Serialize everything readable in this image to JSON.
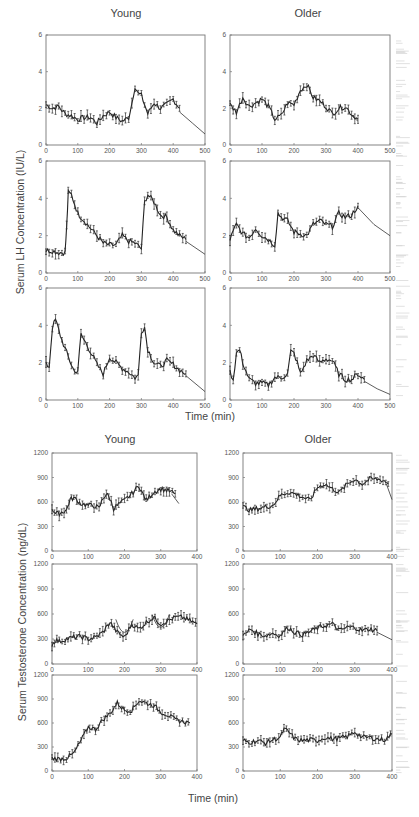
{
  "figure": {
    "top_block": {
      "col_titles": [
        "Young",
        "Older"
      ],
      "ylabel": "Serum LH Concentration (IU/L)",
      "xlabel": "Time (min)"
    },
    "bottom_block": {
      "col_titles": [
        "Young",
        "Older"
      ],
      "ylabel": "Serum Testosterone Concentration (ng/dL)",
      "xlabel": "Time (min)"
    }
  },
  "chart_data": [
    {
      "type": "scatter",
      "panel": "LH Young 1",
      "title": "Young",
      "xlabel": "Time (min)",
      "ylabel": "Serum LH Concentration (IU/L)",
      "xlim": [
        0,
        500
      ],
      "ylim": [
        0,
        6
      ],
      "xticks": [
        0,
        100,
        200,
        300,
        400,
        500
      ],
      "yticks": [
        0,
        2,
        4,
        6
      ],
      "x": [
        0,
        20,
        40,
        60,
        80,
        100,
        120,
        140,
        160,
        180,
        200,
        220,
        240,
        260,
        270,
        280,
        290,
        300,
        320,
        340,
        360,
        380,
        400,
        420
      ],
      "values": [
        2.2,
        2.0,
        2.1,
        1.7,
        1.6,
        1.4,
        1.5,
        1.5,
        1.2,
        1.6,
        1.8,
        1.5,
        1.3,
        1.5,
        2.3,
        3.2,
        2.8,
        2.7,
        1.7,
        2.3,
        2.0,
        2.2,
        2.5,
        2.0
      ],
      "fit_tail": [
        [
          420,
          1.8
        ],
        [
          460,
          1.2
        ],
        [
          500,
          0.6
        ]
      ]
    },
    {
      "type": "scatter",
      "panel": "LH Young 2",
      "xlim": [
        0,
        500
      ],
      "ylim": [
        0,
        6
      ],
      "xticks": [
        0,
        100,
        200,
        300,
        400,
        500
      ],
      "yticks": [
        0,
        2,
        4,
        6
      ],
      "x": [
        0,
        20,
        40,
        60,
        65,
        70,
        80,
        100,
        120,
        140,
        160,
        180,
        200,
        220,
        240,
        260,
        280,
        300,
        310,
        320,
        340,
        360,
        380,
        400,
        420,
        440
      ],
      "values": [
        1.2,
        1.2,
        1.1,
        1.1,
        2.5,
        4.3,
        4.2,
        3.2,
        2.8,
        2.4,
        2.0,
        1.6,
        1.5,
        1.5,
        2.0,
        1.7,
        1.6,
        1.3,
        3.8,
        4.2,
        3.8,
        3.1,
        3.0,
        2.3,
        2.0,
        1.8
      ],
      "fit_tail": [
        [
          440,
          1.7
        ],
        [
          500,
          1.0
        ]
      ]
    },
    {
      "type": "scatter",
      "panel": "LH Young 3",
      "xlim": [
        0,
        500
      ],
      "ylim": [
        0,
        6
      ],
      "xticks": [
        0,
        100,
        200,
        300,
        400,
        500
      ],
      "yticks": [
        0,
        2,
        4,
        6
      ],
      "x": [
        0,
        10,
        20,
        30,
        50,
        70,
        90,
        100,
        110,
        120,
        140,
        160,
        180,
        200,
        220,
        240,
        260,
        280,
        290,
        300,
        310,
        320,
        340,
        360,
        380,
        400,
        420,
        440
      ],
      "values": [
        1.9,
        1.8,
        3.9,
        4.3,
        3.2,
        2.3,
        1.5,
        1.6,
        3.5,
        3.2,
        2.6,
        1.9,
        1.4,
        2.3,
        2.0,
        1.7,
        1.5,
        1.2,
        1.3,
        3.7,
        3.9,
        2.7,
        2.0,
        1.8,
        2.1,
        1.9,
        1.6,
        1.4
      ],
      "fit_tail": [
        [
          440,
          1.3
        ],
        [
          500,
          0.45
        ]
      ]
    },
    {
      "type": "scatter",
      "panel": "LH Older 1",
      "title": "Older",
      "xlim": [
        0,
        500
      ],
      "ylim": [
        0,
        6
      ],
      "xticks": [
        0,
        100,
        200,
        300,
        400,
        500
      ],
      "yticks": [
        0,
        2,
        4,
        6
      ],
      "x": [
        0,
        20,
        40,
        60,
        80,
        100,
        120,
        140,
        160,
        180,
        200,
        220,
        240,
        260,
        280,
        300,
        320,
        340,
        360,
        380,
        400
      ],
      "values": [
        2.2,
        1.8,
        2.6,
        2.1,
        2.3,
        2.5,
        2.1,
        1.4,
        1.6,
        2.3,
        2.2,
        3.0,
        3.3,
        2.6,
        2.4,
        2.1,
        1.7,
        2.0,
        2.1,
        1.7,
        1.4
      ],
      "fit_tail": [
        [
          380,
          1.6
        ],
        [
          400,
          1.3
        ]
      ]
    },
    {
      "type": "scatter",
      "panel": "LH Older 2",
      "xlim": [
        0,
        500
      ],
      "ylim": [
        0,
        6
      ],
      "xticks": [
        0,
        100,
        200,
        300,
        400,
        500
      ],
      "yticks": [
        0,
        2,
        4,
        6
      ],
      "x": [
        0,
        20,
        40,
        60,
        80,
        100,
        120,
        140,
        150,
        160,
        180,
        200,
        220,
        240,
        260,
        280,
        300,
        320,
        340,
        360,
        380,
        400
      ],
      "values": [
        1.8,
        2.6,
        2.1,
        1.9,
        2.4,
        2.0,
        1.8,
        1.5,
        3.2,
        3.0,
        2.8,
        2.2,
        2.1,
        2.0,
        2.6,
        2.8,
        2.6,
        2.5,
        3.2,
        3.0,
        3.1,
        3.6
      ],
      "fit_tail": [
        [
          400,
          3.5
        ],
        [
          450,
          2.6
        ],
        [
          500,
          2.0
        ]
      ]
    },
    {
      "type": "scatter",
      "panel": "LH Older 3",
      "xlim": [
        0,
        500
      ],
      "ylim": [
        0,
        6
      ],
      "xticks": [
        0,
        100,
        200,
        300,
        400,
        500
      ],
      "yticks": [
        0,
        2,
        4,
        6
      ],
      "x": [
        0,
        10,
        20,
        30,
        40,
        60,
        80,
        100,
        120,
        140,
        160,
        180,
        190,
        200,
        210,
        220,
        240,
        260,
        280,
        300,
        320,
        340,
        360,
        380,
        400,
        420
      ],
      "values": [
        1.5,
        1.1,
        2.5,
        2.7,
        2.0,
        1.1,
        0.9,
        0.9,
        0.8,
        1.2,
        1.2,
        1.4,
        2.6,
        2.5,
        2.0,
        1.4,
        2.1,
        2.4,
        2.0,
        2.2,
        2.1,
        1.4,
        1.1,
        1.1,
        1.4,
        1.1
      ],
      "fit_tail": [
        [
          420,
          1.0
        ],
        [
          460,
          0.6
        ],
        [
          500,
          0.3
        ]
      ]
    },
    {
      "type": "scatter",
      "panel": "T Young 1",
      "title": "Young",
      "xlabel": "Time (min)",
      "ylabel": "Serum Testosterone Concentration (ng/dL)",
      "xlim": [
        0,
        400
      ],
      "ylim": [
        0,
        1200
      ],
      "xticks": [
        0,
        100,
        200,
        300,
        400
      ],
      "yticks": [
        0,
        300,
        600,
        900,
        1200
      ],
      "x": [
        0,
        10,
        20,
        30,
        40,
        50,
        60,
        80,
        100,
        120,
        130,
        140,
        150,
        160,
        170,
        180,
        200,
        220,
        240,
        250,
        260,
        280,
        300,
        320,
        340
      ],
      "values": [
        520,
        460,
        460,
        480,
        500,
        630,
        650,
        580,
        560,
        550,
        520,
        640,
        700,
        640,
        520,
        560,
        620,
        700,
        800,
        700,
        620,
        720,
        760,
        740,
        700
      ],
      "fit_tail": [
        [
          330,
          700
        ],
        [
          350,
          580
        ]
      ]
    },
    {
      "type": "scatter",
      "panel": "T Young 2",
      "xlim": [
        0,
        400
      ],
      "ylim": [
        0,
        1200
      ],
      "xticks": [
        0,
        100,
        200,
        300,
        400
      ],
      "yticks": [
        0,
        300,
        600,
        900,
        1200
      ],
      "x": [
        0,
        10,
        20,
        40,
        60,
        80,
        100,
        120,
        140,
        160,
        180,
        200,
        220,
        240,
        260,
        280,
        300,
        320,
        340,
        360,
        380,
        400
      ],
      "values": [
        230,
        290,
        270,
        300,
        320,
        330,
        300,
        320,
        380,
        500,
        380,
        320,
        480,
        420,
        500,
        560,
        480,
        520,
        560,
        560,
        520,
        480
      ],
      "fit_dips": [
        [
          200,
          320
        ],
        [
          300,
          380
        ]
      ]
    },
    {
      "type": "scatter",
      "panel": "T Young 3",
      "xlim": [
        0,
        400
      ],
      "ylim": [
        0,
        1200
      ],
      "xticks": [
        0,
        100,
        200,
        300,
        400
      ],
      "yticks": [
        0,
        300,
        600,
        900,
        1200
      ],
      "x": [
        0,
        20,
        40,
        60,
        80,
        100,
        120,
        140,
        160,
        180,
        200,
        220,
        240,
        260,
        280,
        300,
        320,
        340,
        360,
        380
      ],
      "values": [
        160,
        150,
        160,
        220,
        380,
        550,
        520,
        640,
        720,
        850,
        760,
        760,
        880,
        850,
        820,
        740,
        700,
        640,
        620,
        600
      ]
    },
    {
      "type": "scatter",
      "panel": "T Older 1",
      "title": "Older",
      "xlim": [
        0,
        400
      ],
      "ylim": [
        0,
        1200
      ],
      "xticks": [
        0,
        100,
        200,
        300,
        400
      ],
      "yticks": [
        0,
        300,
        600,
        900,
        1200
      ],
      "x": [
        0,
        20,
        40,
        60,
        80,
        100,
        120,
        140,
        160,
        180,
        200,
        220,
        240,
        260,
        280,
        300,
        320,
        340,
        360,
        380,
        390
      ],
      "values": [
        540,
        500,
        520,
        540,
        560,
        680,
        720,
        700,
        660,
        620,
        780,
        820,
        760,
        720,
        820,
        880,
        820,
        880,
        880,
        860,
        820
      ],
      "fit_tail": [
        [
          385,
          820
        ],
        [
          400,
          630
        ]
      ]
    },
    {
      "type": "scatter",
      "panel": "T Older 2",
      "xlim": [
        0,
        400
      ],
      "ylim": [
        0,
        1200
      ],
      "xticks": [
        0,
        100,
        200,
        300,
        400
      ],
      "yticks": [
        0,
        300,
        600,
        900,
        1200
      ],
      "x": [
        0,
        20,
        40,
        60,
        80,
        100,
        120,
        140,
        160,
        180,
        200,
        220,
        240,
        260,
        280,
        300,
        320,
        340,
        360
      ],
      "values": [
        330,
        420,
        360,
        340,
        370,
        340,
        440,
        380,
        350,
        390,
        430,
        460,
        480,
        400,
        440,
        440,
        400,
        420,
        400
      ],
      "fit_tail": [
        [
          360,
          380
        ],
        [
          400,
          290
        ]
      ]
    },
    {
      "type": "scatter",
      "panel": "T Older 3",
      "xlim": [
        0,
        400
      ],
      "ylim": [
        0,
        1200
      ],
      "xticks": [
        0,
        100,
        200,
        300,
        400
      ],
      "yticks": [
        0,
        300,
        600,
        900,
        1200
      ],
      "x": [
        0,
        20,
        40,
        60,
        80,
        100,
        110,
        120,
        140,
        160,
        180,
        200,
        220,
        240,
        260,
        280,
        300,
        320,
        340,
        360,
        380,
        400
      ],
      "values": [
        380,
        360,
        380,
        350,
        390,
        420,
        520,
        500,
        400,
        380,
        390,
        380,
        420,
        400,
        410,
        430,
        490,
        420,
        420,
        400,
        390,
        460
      ]
    }
  ]
}
